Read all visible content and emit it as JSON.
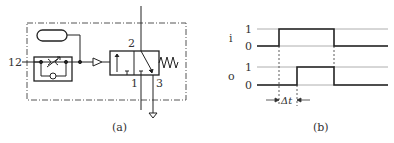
{
  "diagram_a": {
    "caption": "(a)",
    "port_input": "12",
    "port_2": "2",
    "port_1": "1",
    "port_3": "3"
  },
  "diagram_b": {
    "caption": "(b)",
    "signal_i_label": "i",
    "signal_o_label": "o",
    "level_1": "1",
    "level_0": "0",
    "delay_label": "Δt"
  },
  "colors": {
    "line": "#222222",
    "thin_line": "#888888"
  }
}
